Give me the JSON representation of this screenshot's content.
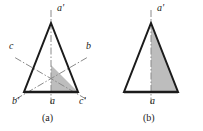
{
  "figure": {
    "background_color": "#ffffff",
    "stroke_color": "#1b1b1b",
    "shade_color": "#bdbdbd",
    "axis_color": "#7a7a7a",
    "panels": [
      {
        "id": "a",
        "caption": "(a)",
        "description": "Equilateral triangle with three mirror axes and shaded asymmetric unit",
        "vertex_labels": {
          "apex": "a'",
          "bottom_left": "b'",
          "bottom_center": "a",
          "bottom_right": "c'",
          "left_mid": "c",
          "right_mid": "b"
        }
      },
      {
        "id": "b",
        "caption": "(b)",
        "description": "Equilateral triangle with single vertical mirror axis and shaded right half",
        "vertex_labels": {
          "apex": "a'",
          "bottom_center": "a"
        }
      }
    ]
  }
}
